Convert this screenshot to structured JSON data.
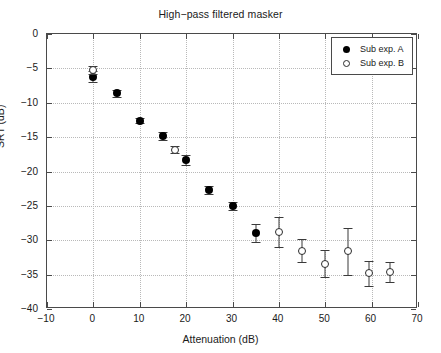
{
  "chart_data": {
    "type": "scatter",
    "title": "High−pass filtered masker",
    "xlabel": "Attenuation (dB)",
    "ylabel": "SRT (dB)",
    "xlim": [
      -10,
      70
    ],
    "ylim": [
      -40,
      0
    ],
    "xticks": [
      -10,
      0,
      10,
      20,
      30,
      40,
      50,
      60,
      70
    ],
    "yticks": [
      0,
      -5,
      -10,
      -15,
      -20,
      -25,
      -30,
      -35,
      -40
    ],
    "grid": true,
    "legend_position": "upper right",
    "series": [
      {
        "name": "Sub exp. A",
        "marker": "filled-circle",
        "color": "#000000",
        "points": [
          {
            "x": 0,
            "y": -6.2,
            "err": 0.8
          },
          {
            "x": 5,
            "y": -8.6,
            "err": 0.5
          },
          {
            "x": 10,
            "y": -12.6,
            "err": 0.4
          },
          {
            "x": 15,
            "y": -14.8,
            "err": 0.6
          },
          {
            "x": 20,
            "y": -18.3,
            "err": 0.7
          },
          {
            "x": 25,
            "y": -22.7,
            "err": 0.6
          },
          {
            "x": 30,
            "y": -25.0,
            "err": 0.6
          },
          {
            "x": 35,
            "y": -29.0,
            "err": 1.3
          }
        ]
      },
      {
        "name": "Sub exp. B",
        "marker": "open-circle",
        "color": "#2b2b2b",
        "points": [
          {
            "x": 0,
            "y": -5.2,
            "err": 0.6
          },
          {
            "x": 17.5,
            "y": -16.8,
            "err": 0.5
          },
          {
            "x": 40,
            "y": -28.8,
            "err": 2.2
          },
          {
            "x": 45,
            "y": -31.5,
            "err": 1.7
          },
          {
            "x": 50,
            "y": -33.4,
            "err": 2.0
          },
          {
            "x": 55,
            "y": -31.6,
            "err": 3.4
          },
          {
            "x": 59.5,
            "y": -34.8,
            "err": 1.8
          },
          {
            "x": 64,
            "y": -34.6,
            "err": 1.4
          }
        ]
      }
    ]
  },
  "legend": {
    "items": [
      {
        "label": "Sub exp. A",
        "marker": "filled-circle"
      },
      {
        "label": "Sub exp. B",
        "marker": "open-circle"
      }
    ]
  }
}
